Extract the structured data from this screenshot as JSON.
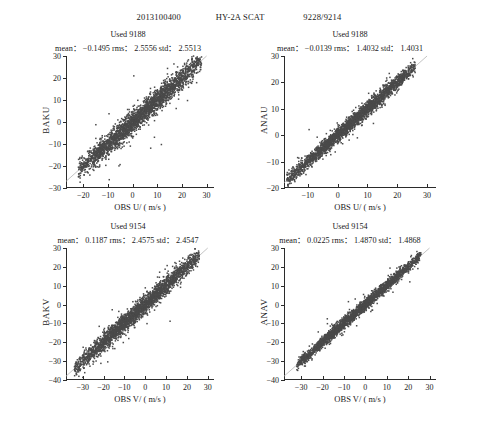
{
  "header": {
    "datetime": "2013100400",
    "instrument": "HY-2A SCAT",
    "counts": "9228/9214"
  },
  "panels": [
    {
      "id": "top-left",
      "used_label": "Used 9188",
      "stats_text": "mean： −0.1495  rms： 2.5556  std： 2.5513",
      "mean": -0.1495,
      "rms": 2.5556,
      "std": 2.5513,
      "ylabel": "BAKU",
      "xlabel": "OBS U/ ( m/s )",
      "yticks": [
        -30,
        -20,
        -10,
        0,
        10,
        20,
        30
      ],
      "xticks": [
        -20,
        -10,
        0,
        10,
        20,
        30
      ],
      "ylim": [
        -30,
        30
      ],
      "xlim": [
        -27,
        33
      ]
    },
    {
      "id": "top-right",
      "used_label": "Used 9188",
      "stats_text": "mean： −0.0139  rms： 1.4032  std： 1.4031",
      "mean": -0.0139,
      "rms": 1.4032,
      "std": 1.4031,
      "ylabel": "ANAU",
      "xlabel": "OBS U/ ( m/s )",
      "yticks": [
        -20,
        -10,
        0,
        10,
        20,
        30
      ],
      "xticks": [
        -10,
        0,
        10,
        20,
        30
      ],
      "ylim": [
        -20,
        30
      ],
      "xlim": [
        -18,
        33
      ]
    },
    {
      "id": "bottom-left",
      "used_label": "Used 9154",
      "stats_text": "mean： 0.1187  rms： 2.4575  std： 2.4547",
      "mean": 0.1187,
      "rms": 2.4575,
      "std": 2.4547,
      "ylabel": "BAKV",
      "xlabel": "OBS V/ ( m/s )",
      "yticks": [
        -40,
        -30,
        -20,
        -10,
        0,
        10,
        20,
        30
      ],
      "xticks": [
        -30,
        -20,
        -10,
        0,
        10,
        20,
        30
      ],
      "ylim": [
        -40,
        30
      ],
      "xlim": [
        -38,
        33
      ]
    },
    {
      "id": "bottom-right",
      "used_label": "Used 9154",
      "stats_text": "mean： 0.0225  rms： 1.4870  std： 1.4868",
      "mean": 0.0225,
      "rms": 1.487,
      "std": 1.4868,
      "ylabel": "ANAV",
      "xlabel": "OBS V/ ( m/s )",
      "yticks": [
        -40,
        -30,
        -20,
        -10,
        0,
        10,
        20,
        30
      ],
      "xticks": [
        -30,
        -20,
        -10,
        0,
        10,
        20,
        30
      ],
      "ylim": [
        -40,
        30
      ],
      "xlim": [
        -38,
        33
      ]
    }
  ],
  "chart_data": {
    "type": "scatter",
    "title": "2013100400  HY-2A SCAT  9228/9214",
    "point_color": "#4a4a4a",
    "reference_line_color": "#b5b5b5",
    "reference_line": "y = x (1:1)",
    "grid": false,
    "legend": "none",
    "panels": [
      {
        "name": "BAKU vs OBS U",
        "xlabel": "OBS U/ ( m/s )",
        "ylabel": "BAKU",
        "n_points": 9188,
        "xlim": [
          -27,
          33
        ],
        "ylim": [
          -30,
          30
        ],
        "spread_rms": 2.5556,
        "bias": -0.1495,
        "data_x_range": [
          -22,
          28
        ],
        "data_y_range": [
          -28,
          27
        ]
      },
      {
        "name": "ANAU vs OBS U",
        "xlabel": "OBS U/ ( m/s )",
        "ylabel": "ANAU",
        "n_points": 9188,
        "xlim": [
          -18,
          33
        ],
        "ylim": [
          -20,
          30
        ],
        "spread_rms": 1.4032,
        "bias": -0.0139,
        "data_x_range": [
          -17,
          26
        ],
        "data_y_range": [
          -18,
          24
        ]
      },
      {
        "name": "BAKV vs OBS V",
        "xlabel": "OBS V/ ( m/s )",
        "ylabel": "BAKV",
        "n_points": 9154,
        "xlim": [
          -38,
          33
        ],
        "ylim": [
          -40,
          30
        ],
        "spread_rms": 2.4575,
        "bias": 0.1187,
        "data_x_range": [
          -34,
          26
        ],
        "data_y_range": [
          -34,
          25
        ]
      },
      {
        "name": "ANAV vs OBS V",
        "xlabel": "OBS V/ ( m/s )",
        "ylabel": "ANAV",
        "n_points": 9154,
        "xlim": [
          -38,
          33
        ],
        "ylim": [
          -40,
          30
        ],
        "spread_rms": 1.487,
        "bias": 0.0225,
        "data_x_range": [
          -32,
          26
        ],
        "data_y_range": [
          -31,
          24
        ]
      }
    ]
  }
}
